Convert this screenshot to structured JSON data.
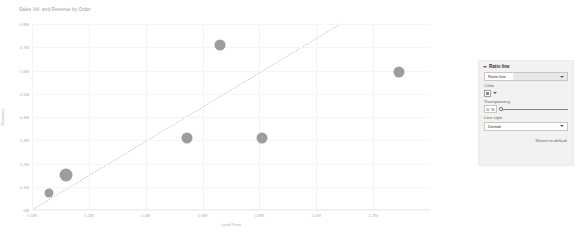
{
  "chart": {
    "title": "Sales Vol. and Revenue by Order",
    "title_more_icon": "ellipsis-icon"
  },
  "panel": {
    "header_label": "Ratio line",
    "chevron_icon": "chevron-down-icon",
    "selected_line": "Ratio line",
    "select_caret_icon": "chevron-down-icon",
    "color_label": "Color",
    "color_value": "#8a8886",
    "color_swatch_icon": "color-swatch-icon",
    "color_caret_icon": "chevron-down-icon",
    "transparency_label": "Transparency",
    "transparency_value": "0",
    "transparency_unit": "%",
    "line_style_label": "Line style",
    "line_style_value": "Dotted",
    "revert_label": "Revert to default"
  },
  "chart_data": {
    "type": "scatter",
    "title": "Sales Vol. and Revenue by Order",
    "xlabel": "Lead Price",
    "ylabel": "Revenue",
    "xlim": [
      0,
      1400000
    ],
    "ylim": [
      0,
      800000
    ],
    "grid": true,
    "legend": null,
    "x_ticks": [
      "0.0M",
      "0.2M",
      "0.4M",
      "0.6M",
      "0.8M",
      "1.0M",
      "1.2M"
    ],
    "x_tick_values": [
      0,
      200000,
      400000,
      600000,
      800000,
      1000000,
      1200000
    ],
    "y_ticks": [
      "0M",
      "0.1M",
      "0.2M",
      "0.3M",
      "0.4M",
      "0.5M",
      "0.6M",
      "0.7M",
      "0.8M"
    ],
    "y_tick_values": [
      0,
      100000,
      200000,
      300000,
      400000,
      500000,
      600000,
      700000,
      800000
    ],
    "marker_color": "#8a8886",
    "points": [
      {
        "x": 60000,
        "y": 75000,
        "size": 9
      },
      {
        "x": 118000,
        "y": 152000,
        "size": 13
      },
      {
        "x": 545000,
        "y": 310000,
        "size": 11
      },
      {
        "x": 660000,
        "y": 710000,
        "size": 11
      },
      {
        "x": 810000,
        "y": 310000,
        "size": 11
      },
      {
        "x": 1290000,
        "y": 595000,
        "size": 11
      }
    ],
    "ratio_line": {
      "name": "Ratio line",
      "style": "dotted",
      "color": "#b9b7b5",
      "from": {
        "x": 0,
        "y": 0
      },
      "to": {
        "x": 1085000,
        "y": 800000
      }
    }
  }
}
